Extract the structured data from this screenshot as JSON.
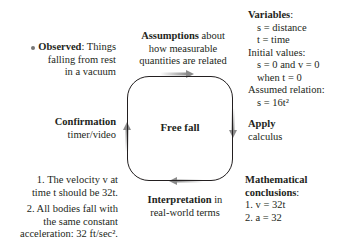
{
  "center": {
    "label": "Free fall"
  },
  "observed": {
    "title": "Observed",
    "rest": ": Things",
    "line2": "falling from rest",
    "line3": "in a vacuum"
  },
  "assumptions": {
    "title": "Assumptions",
    "rest": " about",
    "line2": "how measurable",
    "line3": "quantities are related"
  },
  "variables": {
    "title": "Variables",
    "lines": [
      "s = distance",
      "t = time"
    ],
    "initial_title": "Initial values:",
    "initial_lines": [
      "s = 0 and v = 0",
      "when t = 0"
    ],
    "assumed_title": "Assumed relation:",
    "assumed_line": "s = 16t²"
  },
  "apply": {
    "title": "Apply",
    "line2": "calculus"
  },
  "math": {
    "title1": "Mathematical",
    "title2": "conclusions",
    "lines": [
      "1. v = 32t",
      "2. a = 32"
    ]
  },
  "interpretation": {
    "title": "Interpretation",
    "rest": " in",
    "line2": "real-world terms"
  },
  "confirmation": {
    "title": "Confirmation",
    "line2": "timer/video"
  },
  "predictions": {
    "p1": [
      "1. The velocity v at",
      "time t should be 32t."
    ],
    "p2": [
      "2. All bodies fall with",
      "the same constant",
      "acceleration: 32 ft/sec²."
    ]
  },
  "colors": {
    "text": "#231f20",
    "arrow": "#8a8a8a"
  }
}
